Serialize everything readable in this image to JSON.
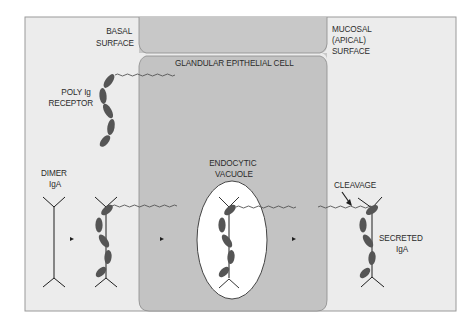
{
  "diagram": {
    "type": "biological-process",
    "colors": {
      "background": "#ffffff",
      "extracellular": "#ececec",
      "cell": "#c3c3c3",
      "cell_band": "#c8c8c8",
      "frame_border": "#9a9a9a",
      "vacuole": "#ffffff",
      "receptor_domain": "#555555",
      "line": "#1e1e1e"
    },
    "labels": {
      "basal_surface": [
        "BASAL",
        "SURFACE"
      ],
      "mucosal_surface": [
        "MUCOSAL",
        "(APICAL)",
        "SURFACE"
      ],
      "cell_name": "GLANDULAR EPITHELIAL CELL",
      "poly_ig_receptor": [
        "POLY Ig",
        "RECEPTOR"
      ],
      "dimer_iga": [
        "DIMER",
        "IgA"
      ],
      "endocytic_vacuole": [
        "ENDOCYTIC",
        "VACUOLE"
      ],
      "cleavage": "CLEAVAGE",
      "secreted_iga": [
        "SECRETED",
        "IgA"
      ]
    },
    "stages": [
      "Dimer IgA",
      "IgA bound to poly Ig receptor at basal surface",
      "IgA-receptor complex in endocytic vacuole",
      "Secreted IgA after cleavage at mucosal surface"
    ]
  }
}
